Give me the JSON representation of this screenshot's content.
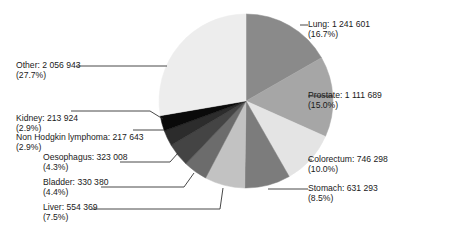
{
  "chart_data": {
    "type": "pie",
    "title": "",
    "center": [
      246,
      101
    ],
    "radius": 87,
    "start_angle_deg": 0,
    "direction": "clockwise",
    "slices": [
      {
        "label": "Lung",
        "value": 1241601,
        "value_text": "1 241 601",
        "percent": 16.7,
        "percent_text": "(16.7%)",
        "color": "#8a8a8a"
      },
      {
        "label": "Prostate",
        "value": 1111689,
        "value_text": "1 111 689",
        "percent": 15.0,
        "percent_text": "(15.0%)",
        "color": "#a6a6a6"
      },
      {
        "label": "Colorectum",
        "value": 746298,
        "value_text": "746 298",
        "percent": 10.0,
        "percent_text": "(10.0%)",
        "color": "#e4e4e4"
      },
      {
        "label": "Stomach",
        "value": 631293,
        "value_text": "631 293",
        "percent": 8.5,
        "percent_text": "(8.5%)",
        "color": "#7c7c7c"
      },
      {
        "label": "Liver",
        "value": 554369,
        "value_text": "554 369",
        "percent": 7.5,
        "percent_text": "(7.5%)",
        "color": "#c2c2c2"
      },
      {
        "label": "Bladder",
        "value": 330380,
        "value_text": "330 380",
        "percent": 4.4,
        "percent_text": "(4.4%)",
        "color": "#6c6c6c"
      },
      {
        "label": "Oesophagus",
        "value": 323008,
        "value_text": "323 008",
        "percent": 4.3,
        "percent_text": "(4.3%)",
        "color": "#444444"
      },
      {
        "label": "Non Hodgkin lymphoma",
        "value": 217643,
        "value_text": "217 643",
        "percent": 2.9,
        "percent_text": "(2.9%)",
        "color": "#2c2c2c"
      },
      {
        "label": "Kidney",
        "value": 213924,
        "value_text": "213 924",
        "percent": 2.9,
        "percent_text": "(2.9%)",
        "color": "#0a0a0a"
      },
      {
        "label": "Other",
        "value": 2056943,
        "value_text": "2 056 943",
        "percent": 27.7,
        "percent_text": "(27.7%)",
        "color": "#ededed"
      }
    ],
    "labels_layout": [
      {
        "x": 308,
        "y": 19,
        "line": [
          [
            300,
            25
          ],
          [
            308,
            25
          ]
        ]
      },
      {
        "x": 308,
        "y": 90,
        "line": [
          [
            333,
            96
          ],
          [
            308,
            96
          ]
        ]
      },
      {
        "x": 308,
        "y": 154,
        "line": [
          [
            312,
            160
          ],
          [
            308,
            160
          ]
        ]
      },
      {
        "x": 308,
        "y": 183,
        "line": [
          [
            268,
            189
          ],
          [
            308,
            189
          ]
        ]
      },
      {
        "x": 43,
        "y": 202,
        "line": [
          [
            223,
            188
          ],
          [
            220,
            209
          ],
          [
            92,
            209
          ]
        ]
      },
      {
        "x": 43,
        "y": 177,
        "line": [
          [
            194,
            173
          ],
          [
            184,
            187
          ],
          [
            101,
            187
          ]
        ]
      },
      {
        "x": 43,
        "y": 152,
        "line": [
          [
            178,
            153
          ],
          [
            170,
            162
          ],
          [
            120,
            162
          ]
        ]
      },
      {
        "x": 16,
        "y": 132,
        "line": [
          [
            164,
            130
          ],
          [
            133,
            130
          ]
        ]
      },
      {
        "x": 16,
        "y": 113,
        "line": [
          [
            163,
            119
          ],
          [
            150,
            111
          ],
          [
            71,
            111
          ]
        ]
      },
      {
        "x": 16,
        "y": 60,
        "line": [
          [
            167,
            66
          ],
          [
            76,
            66
          ]
        ]
      }
    ]
  }
}
